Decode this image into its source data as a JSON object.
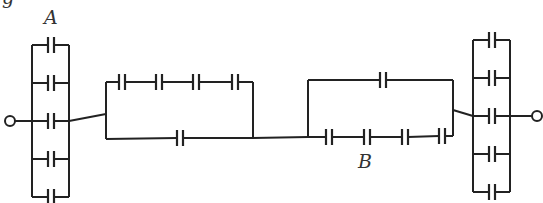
{
  "diagram": {
    "type": "capacitor-network",
    "labels": {
      "left_bank": "A",
      "right_series": "B",
      "top_partial": "g"
    },
    "colors": {
      "wire": "#222222",
      "label": "#333333",
      "background": "#ffffff"
    },
    "left_bank": {
      "capacitors": 5,
      "connection": "parallel"
    },
    "block1": {
      "top_series_capacitors": 4,
      "bottom_capacitors": 1
    },
    "block2": {
      "top_capacitors": 1,
      "bottom_series_capacitors": 4
    },
    "right_bank": {
      "capacitors": 5,
      "connection": "parallel"
    },
    "terminals": [
      "left-terminal",
      "right-terminal"
    ]
  }
}
